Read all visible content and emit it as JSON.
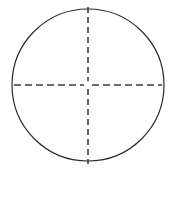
{
  "figure": {
    "name": "circle-with-dashed-crosshair-axes",
    "canvas": {
      "width": 174,
      "height": 211,
      "background_color": "#ffffff"
    },
    "circle": {
      "center_x": 88,
      "center_y": 85,
      "radius": 76,
      "stroke_color": "#2b2b2b",
      "stroke_width": 1.2,
      "fill": "none"
    },
    "vertical_axis": {
      "label": "vertical diameter",
      "x": 88,
      "y_start": 7,
      "y_end": 164,
      "stroke_color": "#3a3a3a",
      "stroke_width": 1.6,
      "dash": 6,
      "gap": 4
    },
    "horizontal_axis": {
      "label": "horizontal diameter",
      "y": 85,
      "x_start": 14,
      "x_end": 162,
      "stroke_color": "#3a3a3a",
      "stroke_width": 1.6,
      "dash": 7,
      "gap": 4
    },
    "center_gap_radius": 4,
    "caption": ""
  }
}
